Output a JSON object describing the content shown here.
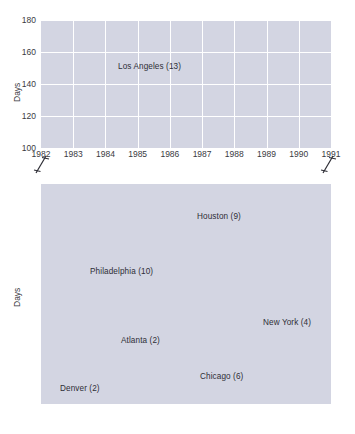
{
  "figure": {
    "ylabel_top": "Days",
    "ylabel_bottom": "Days",
    "background": "#d3d5e2",
    "gridcolor": "#ffffff"
  },
  "chart_data": [
    {
      "type": "line",
      "panel": "top",
      "title": "",
      "xlabel": "",
      "ylabel": "Days",
      "x": [
        1982,
        1983,
        1984,
        1985,
        1986,
        1987,
        1988,
        1989,
        1990,
        1991
      ],
      "xlim": [
        1982,
        1991
      ],
      "ylim": [
        100,
        180
      ],
      "yticks": [
        100,
        120,
        140,
        160,
        180
      ],
      "xticks": [
        "1982",
        "1983",
        "1984",
        "1985",
        "1986",
        "1987",
        "1988",
        "1989",
        "1990",
        "1991"
      ],
      "grid": true,
      "axis_break": true,
      "series": [
        {
          "name": "Los Angeles (13)",
          "label": "Los Angeles (13)",
          "color": "#c4522c",
          "values": [
            133,
            143,
            153,
            153.5,
            159.5,
            144,
            166,
            140,
            115,
            105
          ]
        }
      ]
    },
    {
      "type": "line",
      "panel": "bottom",
      "title": "",
      "xlabel": "",
      "ylabel": "Days",
      "x": [
        1982,
        1983,
        1984,
        1985,
        1986,
        1987,
        1988,
        1989,
        1990,
        1991
      ],
      "xlim": [
        1982,
        1991
      ],
      "ylim": [
        0,
        70
      ],
      "yticks": [
        0,
        10,
        20,
        30,
        40,
        50,
        60,
        70
      ],
      "xticks": [
        "1982",
        "1983",
        "1984",
        "1985",
        "1986",
        "1987",
        "1988",
        "1989",
        "1990",
        "1991"
      ],
      "grid": true,
      "axis_break": true,
      "series": [
        {
          "name": "Houston (9)",
          "label": "Houston (9)",
          "color": "#c4522c",
          "values": [
            45,
            67.5,
            48,
            46,
            41.5,
            50.5,
            48,
            31.5,
            47,
            36.5
          ]
        },
        {
          "name": "Philadelphia (10)",
          "label": "Philadelphia (10)",
          "color": "#9a8529",
          "values": [
            32.5,
            51.5,
            21,
            24,
            19,
            31.5,
            32.5,
            15.5,
            11,
            22
          ]
        },
        {
          "name": "New York (4)",
          "label": "New York (4)",
          "color": "#6e9355",
          "values": [
            20.5,
            29,
            12,
            13.5,
            7,
            13.5,
            30,
            2,
            7,
            12.5
          ]
        },
        {
          "name": "Atlanta (2)",
          "label": "Atlanta (2)",
          "color": "#c9a24a",
          "values": [
            11,
            22,
            8,
            9,
            16,
            19,
            14.5,
            3.5,
            16,
            5
          ]
        },
        {
          "name": "Chicago (6)",
          "label": "Chicago (6)",
          "color": "#6f9dd0",
          "values": [
            5,
            14,
            4.5,
            5,
            2,
            9,
            14,
            1,
            0.5,
            5
          ]
        },
        {
          "name": "Denver (2)",
          "label": "Denver (2)",
          "color": "#6b3f63",
          "values": [
            4,
            11.5,
            1.5,
            0.7,
            0.6,
            4.5,
            3.5,
            1,
            0.6,
            0.6
          ]
        }
      ]
    }
  ],
  "annotations": {
    "los_angeles": "Los Angeles (13)",
    "houston": "Houston (9)",
    "philadelphia": "Philadelphia (10)",
    "new_york": "New York (4)",
    "atlanta": "Atlanta (2)",
    "chicago": "Chicago (6)",
    "denver": "Denver (2)"
  }
}
